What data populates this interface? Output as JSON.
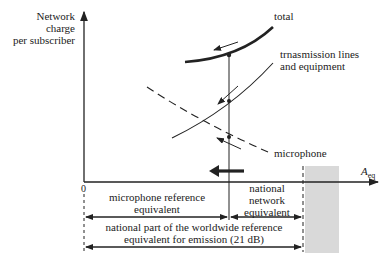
{
  "y_axis": {
    "label_lines": [
      "Network",
      "charge",
      "per subscriber"
    ]
  },
  "x_axis": {
    "label": "A",
    "label_sub": "eq",
    "origin": "0"
  },
  "curves": {
    "total": "total",
    "transmission_line1": "trnasmission lines",
    "transmission_line2": "and equipment",
    "microphone": "microphone"
  },
  "dimensions": {
    "microphone_ref_line1": "microphone reference",
    "microphone_ref_line2": "equivalent",
    "national_network_line1": "national",
    "national_network_line2": "network",
    "national_network_line3": "equivalent",
    "national_part_line1": "national part of the worldwide reference",
    "national_part_line2": "equivalent for emission (21 dB)"
  },
  "colors": {
    "ink": "#222222",
    "shade": "#d9d9d9"
  }
}
